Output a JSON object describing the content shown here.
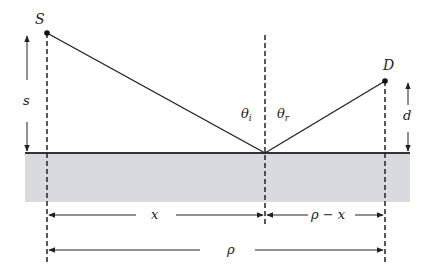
{
  "diagram": {
    "points": {
      "source": {
        "label": "S",
        "x": 47,
        "y": 33
      },
      "destination": {
        "label": "D",
        "x": 385,
        "y": 81
      },
      "reflection": {
        "x": 265,
        "y": 153
      }
    },
    "surface": {
      "y": 153,
      "x_start": 25,
      "x_end": 410,
      "band_bottom": 202,
      "fill": "#d9dadf",
      "line_color": "#333333"
    },
    "angles": {
      "incident": "θ",
      "incident_sub": "i",
      "reflected": "θ",
      "reflected_sub": "r"
    },
    "heights": {
      "source": "s",
      "destination": "d"
    },
    "distances": {
      "horizontal_incident": "x",
      "horizontal_reflected": "ρ − x",
      "total": "ρ"
    }
  }
}
